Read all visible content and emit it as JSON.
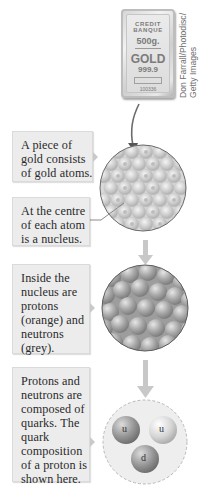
{
  "photo": {
    "subject": "gold bar",
    "bar_text": {
      "line1": "CREDIT",
      "line2": "BANQUE",
      "weight": "500g.",
      "metal": "GOLD",
      "purity": "999.9",
      "serial": "100336"
    },
    "credit_line1": "Don Farrall/Photodisc/",
    "credit_line2": "Getty Images"
  },
  "panels": [
    {
      "lines": [
        "A piece of",
        "gold consists",
        "of gold atoms."
      ]
    },
    {
      "lines": [
        "At the centre",
        "of each atom",
        "is a nucleus."
      ]
    },
    {
      "lines": [
        "Inside the",
        "nucleus are",
        "protons",
        "(orange) and",
        "neutrons",
        "(grey)."
      ]
    },
    {
      "lines": [
        "Protons and",
        "neutrons are",
        "composed of",
        "quarks. The",
        "quark",
        "composition",
        "of a proton is",
        "shown here."
      ]
    }
  ],
  "illustrations": {
    "atoms_circle": {
      "label": "gold atoms lattice",
      "icon": "atom-lattice-icon"
    },
    "nucleus_circle": {
      "label": "nucleus of protons and neutrons",
      "icon": "nucleus-icon"
    },
    "proton_circle": {
      "label": "proton quark composition",
      "quarks": [
        "u",
        "u",
        "d"
      ]
    }
  },
  "colors": {
    "panel_bg": "#ececec",
    "arrow": "#c8c8c8",
    "curve_arrow": "#6b6b6b"
  }
}
